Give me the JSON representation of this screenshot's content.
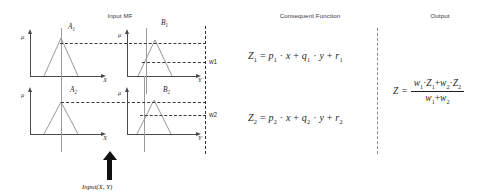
{
  "headers": {
    "input_mf": "Input MF",
    "consequent": "Consequent Function",
    "output": "Output"
  },
  "plots": [
    {
      "id": "a1",
      "mf_label": "A",
      "mf_sub": "1",
      "y_axis_label": "μ",
      "x_axis_label": "X"
    },
    {
      "id": "b1",
      "mf_label": "B",
      "mf_sub": "1",
      "y_axis_label": "μ",
      "x_axis_label": "Y"
    },
    {
      "id": "a2",
      "mf_label": "A",
      "mf_sub": "2",
      "y_axis_label": "μ",
      "x_axis_label": "X"
    },
    {
      "id": "b2",
      "mf_label": "B",
      "mf_sub": "2",
      "y_axis_label": "μ",
      "x_axis_label": "Y"
    }
  ],
  "firing_strengths": [
    {
      "label": "w1"
    },
    {
      "label": "w2"
    }
  ],
  "input_arrow": {
    "caption": "Input(X, Y)"
  },
  "equations": {
    "z1": {
      "lhs": "Z",
      "lhs_sub": "1",
      "eq": "=",
      "p": "p",
      "p_sub": "1",
      "dot1": "·",
      "x": "x",
      "plus1": "+",
      "q": "q",
      "q_sub": "1",
      "dot2": "·",
      "y": "y",
      "plus2": "+",
      "r": "r",
      "r_sub": "1"
    },
    "z2": {
      "lhs": "Z",
      "lhs_sub": "2",
      "eq": "=",
      "p": "p",
      "p_sub": "2",
      "dot1": "·",
      "x": "x",
      "plus1": "+",
      "q": "q",
      "q_sub": "2",
      "dot2": "·",
      "y": "y",
      "plus2": "+",
      "r": "r",
      "r_sub": "2"
    },
    "output": {
      "lhs": "Z",
      "eq": "=",
      "num_w1": "w",
      "num_w1_sub": "1",
      "num_dot1": "·",
      "num_z1": "Z",
      "num_z1_sub": "1",
      "num_plus": "+",
      "num_w2": "w",
      "num_w2_sub": "2",
      "num_dot2": "·",
      "num_z2": "Z",
      "num_z2_sub": "2",
      "den_w1": "w",
      "den_w1_sub": "1",
      "den_plus": "+",
      "den_w2": "w",
      "den_w2_sub": "2"
    }
  },
  "colors": {
    "axis": "#4a4a4a",
    "mf_stroke": "#8c8c8c",
    "dash": "#3b3b3b",
    "separator": "#8a8a8a",
    "arrow": "#111111",
    "text": "#262626"
  }
}
